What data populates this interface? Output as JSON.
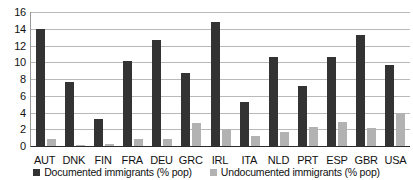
{
  "chart_data": {
    "type": "bar",
    "title": "",
    "subtitle": "",
    "xlabel": "",
    "ylabel": "",
    "ylim": [
      0,
      16
    ],
    "yticks": [
      0,
      2,
      4,
      6,
      8,
      10,
      12,
      14,
      16
    ],
    "grid": true,
    "legend_position": "bottom",
    "categories": [
      "AUT",
      "DNK",
      "FIN",
      "FRA",
      "DEU",
      "GRC",
      "IRL",
      "ITA",
      "NLD",
      "PRT",
      "ESP",
      "GBR",
      "USA"
    ],
    "series": [
      {
        "name": "Documented immigrants (% pop)",
        "color": "#333333",
        "values": [
          14.0,
          7.7,
          3.2,
          10.2,
          12.7,
          8.7,
          14.8,
          5.2,
          10.6,
          7.2,
          10.6,
          13.2,
          9.7
        ]
      },
      {
        "name": "Undocumented immigrants (% pop)",
        "color": "#b2b2b2",
        "values": [
          0.8,
          0.1,
          0.25,
          0.8,
          0.8,
          2.7,
          2.0,
          1.2,
          1.7,
          2.3,
          2.9,
          2.1,
          4.0
        ]
      }
    ]
  },
  "axes": {
    "y_tick_labels": [
      "16",
      "14",
      "12",
      "10",
      "8",
      "6",
      "4",
      "2",
      "0"
    ],
    "x_tick_labels": [
      "AUT",
      "DNK",
      "FIN",
      "FRA",
      "DEU",
      "GRC",
      "IRL",
      "ITA",
      "NLD",
      "PRT",
      "ESP",
      "GBR",
      "USA"
    ]
  },
  "legend": {
    "entries": [
      {
        "label": "Documented immigrants (% pop)",
        "color": "#333333",
        "swatch": "square-swatch-dark"
      },
      {
        "label": "Undocumented immigrants (% pop)",
        "color": "#b2b2b2",
        "swatch": "square-swatch-light"
      }
    ]
  }
}
